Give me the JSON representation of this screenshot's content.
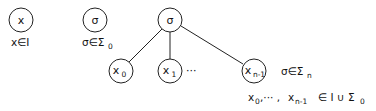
{
  "diagram": {
    "nodes": [
      {
        "id": "leaf-x",
        "label": "x",
        "sub": "",
        "cx": 21,
        "cy": 20,
        "r": 12
      },
      {
        "id": "leaf-sigma",
        "label": "σ",
        "sub": "",
        "cx": 95,
        "cy": 20,
        "r": 12
      },
      {
        "id": "root-sigma",
        "label": "σ",
        "sub": "",
        "cx": 170,
        "cy": 20,
        "r": 12
      },
      {
        "id": "child-x0",
        "label": "x",
        "sub": "0",
        "cx": 121,
        "cy": 71,
        "r": 12
      },
      {
        "id": "child-x1",
        "label": "x",
        "sub": "1",
        "cx": 170,
        "cy": 71,
        "r": 12
      },
      {
        "id": "child-xn-1",
        "label": "x",
        "sub": "n-1",
        "cx": 254,
        "cy": 71,
        "r": 12
      }
    ],
    "edges": [
      {
        "from": "root-sigma",
        "to": "child-x0"
      },
      {
        "from": "root-sigma",
        "to": "child-x1"
      },
      {
        "from": "root-sigma",
        "to": "child-xn-1"
      }
    ],
    "ellipsis": "···",
    "captions": {
      "leaf_x": {
        "main": "x∈I"
      },
      "leaf_sigma": {
        "main": "σ∈Σ",
        "sub": "0"
      },
      "tree": {
        "main": "σ∈Σ",
        "sub": "n"
      },
      "children": {
        "x0": "x",
        "x0_sub": "0",
        "sep": ",··· ,",
        "xn": "x",
        "xn_sub": "n-1",
        "set": "∈ I ∪ Σ",
        "set_sub": "0"
      }
    }
  }
}
